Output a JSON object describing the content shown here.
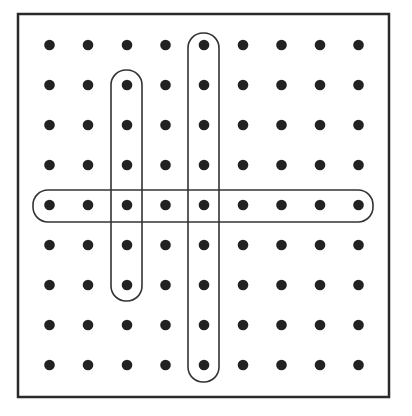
{
  "diagram": {
    "type": "dot-grid",
    "rows": 9,
    "cols": 9,
    "frame": {
      "x": 18,
      "y": 14,
      "width": 371,
      "height": 383,
      "stroke": "#2a2a2a",
      "stroke_width": 2.5
    },
    "grid": {
      "x_positions": [
        49.5,
        88,
        127,
        165.5,
        204,
        243,
        281.5,
        320,
        358.5
      ],
      "y_positions": [
        45,
        85,
        125,
        165,
        205,
        245,
        285,
        325,
        365
      ],
      "dot_radius": 5.3,
      "dot_color": "#222222"
    },
    "groupings": [
      {
        "name": "horizontal-row-5",
        "orientation": "horizontal",
        "row": 5,
        "from_col": 1,
        "to_col": 9,
        "x": 33,
        "y": 190,
        "width": 340,
        "height": 32,
        "radius": 15
      },
      {
        "name": "vertical-col-3",
        "orientation": "vertical",
        "col": 3,
        "from_row": 2,
        "to_row": 7,
        "x": 111,
        "y": 70,
        "width": 31,
        "height": 231,
        "radius": 15
      },
      {
        "name": "vertical-col-5",
        "orientation": "vertical",
        "col": 5,
        "from_row": 1,
        "to_row": 9,
        "x": 188,
        "y": 33,
        "width": 31,
        "height": 349,
        "radius": 15
      }
    ],
    "outline_stroke": "#333333",
    "outline_stroke_width": 1.6
  }
}
